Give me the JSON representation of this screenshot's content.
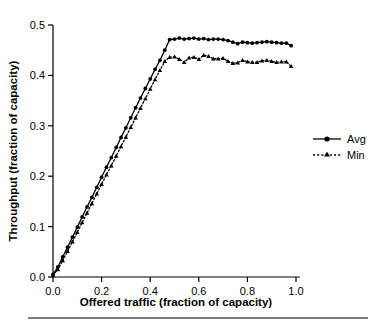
{
  "figure": {
    "background_color": "#ffffff",
    "ink_color": "#000000",
    "footer_rule": true
  },
  "chart_data": {
    "type": "line",
    "title": "",
    "subtitle": "",
    "xlabel": "Offered traffic (fraction of capacity)",
    "ylabel": "Throughput (fraction of capacity)",
    "xlim": [
      0.0,
      1.0
    ],
    "ylim": [
      0.0,
      0.5
    ],
    "xticks": [
      "0.0",
      "0.2",
      "0.4",
      "0.6",
      "0.8",
      "1.0"
    ],
    "xtick_values": [
      0.0,
      0.2,
      0.4,
      0.6,
      0.8,
      1.0
    ],
    "yticks": [
      "0.0",
      "0.1",
      "0.2",
      "0.3",
      "0.4",
      "0.5"
    ],
    "ytick_values": [
      0.0,
      0.1,
      0.2,
      0.3,
      0.4,
      0.5
    ],
    "grid": false,
    "legend_position": "right",
    "legend_entries": [
      "Avg",
      "Min"
    ],
    "series": [
      {
        "name": "Avg",
        "marker": "circle",
        "line_style": "solid",
        "color": "#000000",
        "x": [
          0.0,
          0.02,
          0.04,
          0.06,
          0.08,
          0.1,
          0.12,
          0.14,
          0.16,
          0.18,
          0.2,
          0.22,
          0.24,
          0.26,
          0.28,
          0.3,
          0.32,
          0.34,
          0.36,
          0.38,
          0.4,
          0.42,
          0.44,
          0.46,
          0.48,
          0.5,
          0.52,
          0.54,
          0.56,
          0.58,
          0.6,
          0.62,
          0.64,
          0.66,
          0.68,
          0.7,
          0.72,
          0.74,
          0.76,
          0.78,
          0.8,
          0.82,
          0.84,
          0.86,
          0.88,
          0.9,
          0.92,
          0.94,
          0.96,
          0.98
        ],
        "values": [
          0.005,
          0.02,
          0.04,
          0.059,
          0.079,
          0.099,
          0.119,
          0.139,
          0.158,
          0.178,
          0.198,
          0.218,
          0.237,
          0.257,
          0.277,
          0.296,
          0.316,
          0.336,
          0.355,
          0.374,
          0.393,
          0.412,
          0.43,
          0.45,
          0.471,
          0.472,
          0.474,
          0.472,
          0.473,
          0.474,
          0.472,
          0.473,
          0.471,
          0.472,
          0.472,
          0.471,
          0.469,
          0.466,
          0.463,
          0.466,
          0.465,
          0.464,
          0.465,
          0.466,
          0.467,
          0.466,
          0.465,
          0.464,
          0.464,
          0.459
        ]
      },
      {
        "name": "Min",
        "marker": "triangle",
        "line_style": "dotted",
        "color": "#000000",
        "x": [
          0.0,
          0.02,
          0.04,
          0.06,
          0.08,
          0.1,
          0.12,
          0.14,
          0.16,
          0.18,
          0.2,
          0.22,
          0.24,
          0.26,
          0.28,
          0.3,
          0.32,
          0.34,
          0.36,
          0.38,
          0.4,
          0.42,
          0.44,
          0.46,
          0.48,
          0.5,
          0.52,
          0.54,
          0.56,
          0.58,
          0.6,
          0.62,
          0.64,
          0.66,
          0.68,
          0.7,
          0.72,
          0.74,
          0.76,
          0.78,
          0.8,
          0.82,
          0.84,
          0.86,
          0.88,
          0.9,
          0.92,
          0.94,
          0.96,
          0.98
        ],
        "values": [
          0.003,
          0.015,
          0.033,
          0.051,
          0.07,
          0.089,
          0.108,
          0.127,
          0.146,
          0.165,
          0.184,
          0.203,
          0.221,
          0.24,
          0.259,
          0.278,
          0.297,
          0.316,
          0.335,
          0.354,
          0.373,
          0.392,
          0.41,
          0.428,
          0.436,
          0.437,
          0.432,
          0.426,
          0.435,
          0.436,
          0.432,
          0.44,
          0.438,
          0.433,
          0.433,
          0.434,
          0.428,
          0.424,
          0.425,
          0.43,
          0.427,
          0.426,
          0.426,
          0.429,
          0.43,
          0.428,
          0.426,
          0.427,
          0.427,
          0.418
        ]
      }
    ]
  }
}
